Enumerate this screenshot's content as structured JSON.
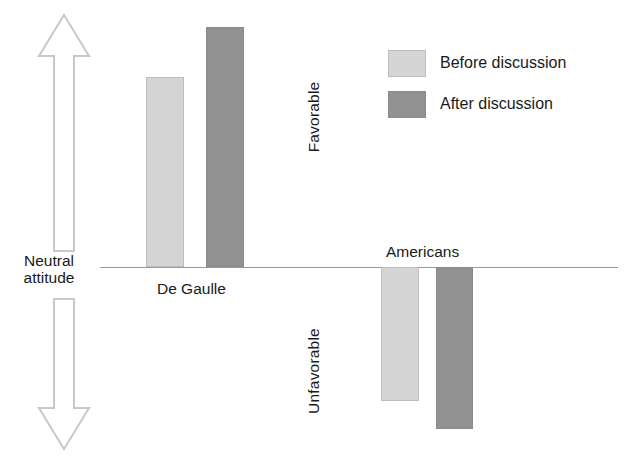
{
  "chart_data": {
    "type": "bar",
    "title": "",
    "subtitle": "",
    "xlabel": "",
    "ylabel": "Attitude",
    "categories": [
      "De Gaulle",
      "Americans"
    ],
    "series": [
      {
        "name": "Before discussion",
        "color": "#d4d4d4",
        "values": [
          1.9,
          -1.34
        ]
      },
      {
        "name": "After discussion",
        "color": "#919191",
        "values": [
          2.4,
          -1.62
        ]
      }
    ],
    "axis": {
      "neutral_line": 0,
      "positive_direction_label": "Favorable",
      "negative_direction_label": "Unfavorable",
      "origin_label_line1": "Neutral",
      "origin_label_line2": "attitude",
      "grid": false,
      "ylim": [
        -2.0,
        2.8
      ]
    },
    "legend": {
      "position": "top-right",
      "entries": [
        {
          "label": "Before discussion",
          "color": "#d4d4d4"
        },
        {
          "label": "After discussion",
          "color": "#919191"
        }
      ]
    },
    "annotations": [
      {
        "text": "De Gaulle",
        "placement": "below-axis"
      },
      {
        "text": "Americans",
        "placement": "above-axis"
      }
    ]
  },
  "colors": {
    "before": "#d4d4d4",
    "after": "#919191",
    "arrow_outline": "#c8c8c8",
    "axis_line": "#9a9a9a",
    "text": "#1a1a1a",
    "background": "#ffffff"
  }
}
